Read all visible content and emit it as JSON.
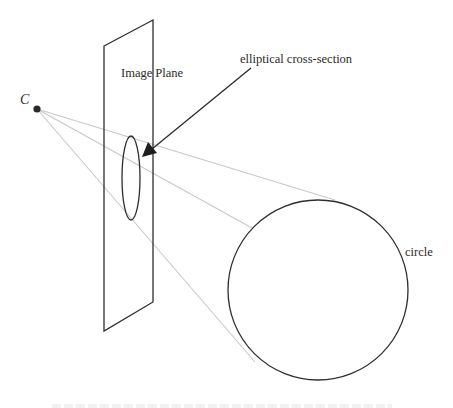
{
  "diagram": {
    "center_point_label": "C",
    "plane_label": "Image Plane",
    "cross_section_label": "elliptical cross-section",
    "circle_label": "circle",
    "colors": {
      "outline": "#2e2e2e",
      "ray": "#c8c8c8",
      "text": "#2a2a2a",
      "background": "#ffffff"
    },
    "geometry": {
      "center_point": [
        37,
        109
      ],
      "plane_corners": [
        [
          104,
          46
        ],
        [
          153,
          20
        ],
        [
          153,
          302
        ],
        [
          104,
          331
        ]
      ],
      "ellipse": {
        "cx": 131,
        "cy": 178,
        "rx": 9,
        "ry": 42
      },
      "circle": {
        "cx": 318,
        "cy": 290,
        "r": 90
      },
      "rays_to": [
        [
          335,
          200
        ],
        [
          252,
          228
        ],
        [
          255,
          362
        ]
      ],
      "arrow": {
        "from": [
          251,
          68
        ],
        "to": [
          142,
          157
        ]
      }
    }
  }
}
